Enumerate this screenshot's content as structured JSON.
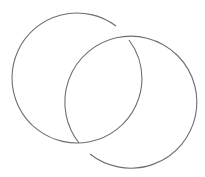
{
  "diagram": {
    "type": "interlocking-rings",
    "stroke_color": "#6e6e6e",
    "background": "#ffffff",
    "rings": [
      {
        "name": "left-ring",
        "cx": 77,
        "cy": 79,
        "r": 65
      },
      {
        "name": "right-ring",
        "cx": 129,
        "cy": 101,
        "r": 66
      }
    ]
  }
}
